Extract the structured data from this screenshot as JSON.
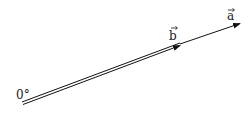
{
  "diagram": {
    "origin_label": "0°",
    "vector_b": {
      "label": "b",
      "style": "double-line"
    },
    "vector_a": {
      "label": "a",
      "style": "single-line"
    },
    "stroke_color": "#111111"
  }
}
